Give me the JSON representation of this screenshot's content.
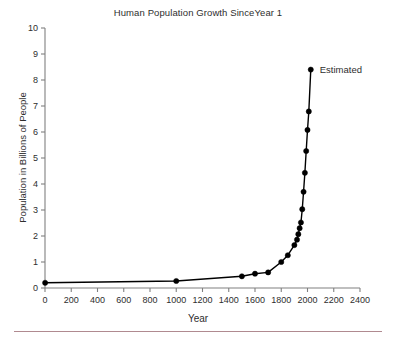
{
  "figure": {
    "background_color": "#ffffff",
    "line_color": "#000000",
    "marker_color": "#000000",
    "axis_color": "#808080",
    "text_color": "#2e2e2e",
    "rule_color": "#b08a90"
  },
  "title": "Human Population Growth SinceYear 1",
  "xlabel": "Year",
  "ylabel": "Population in Billions of People",
  "annotation": "Estimated",
  "xticks": [
    "0",
    "200",
    "400",
    "600",
    "800",
    "1000",
    "1200",
    "1400",
    "1600",
    "1800",
    "2000",
    "2200",
    "2400"
  ],
  "yticks": [
    "0",
    "1",
    "2",
    "3",
    "4",
    "5",
    "6",
    "7",
    "8",
    "9",
    "10"
  ],
  "chart_data": {
    "type": "line",
    "title": "Human Population Growth SinceYear 1",
    "xlabel": "Year",
    "ylabel": "Population in Billions of People",
    "xlim": [
      0,
      2400
    ],
    "ylim": [
      0,
      10
    ],
    "xticks": [
      0,
      200,
      400,
      600,
      800,
      1000,
      1200,
      1400,
      1600,
      1800,
      2000,
      2200,
      2400
    ],
    "yticks": [
      0,
      1,
      2,
      3,
      4,
      5,
      6,
      7,
      8,
      9,
      10
    ],
    "grid": false,
    "legend": false,
    "marker": "filled-circle",
    "annotations": [
      {
        "text": "Estimated",
        "x": 2025,
        "y": 8.4,
        "position": "right-of-point"
      }
    ],
    "series": [
      {
        "name": "World population",
        "x": [
          1,
          1000,
          1500,
          1600,
          1700,
          1800,
          1850,
          1900,
          1920,
          1930,
          1940,
          1950,
          1960,
          1970,
          1980,
          1990,
          2000,
          2010,
          2025
        ],
        "y": [
          0.2,
          0.27,
          0.45,
          0.55,
          0.6,
          1.0,
          1.26,
          1.65,
          1.86,
          2.07,
          2.3,
          2.52,
          3.03,
          3.7,
          4.43,
          5.27,
          6.08,
          6.79,
          8.4
        ]
      }
    ]
  }
}
